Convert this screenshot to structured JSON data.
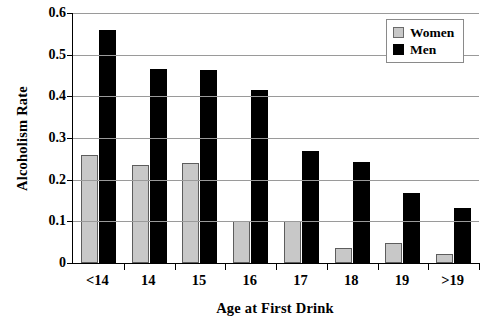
{
  "chart_data": {
    "type": "bar",
    "title": "",
    "xlabel": "Age at First Drink",
    "ylabel": "Alcoholism Rate",
    "categories": [
      "<14",
      "14",
      "15",
      "16",
      "17",
      "18",
      "19",
      ">19"
    ],
    "series": [
      {
        "name": "Women",
        "color": "#c8c8c8",
        "values": [
          0.26,
          0.236,
          0.239,
          0.102,
          0.102,
          0.035,
          0.047,
          0.021
        ]
      },
      {
        "name": "Men",
        "color": "#000000",
        "values": [
          0.56,
          0.465,
          0.464,
          0.415,
          0.27,
          0.242,
          0.167,
          0.131
        ]
      }
    ],
    "ylim": [
      0,
      0.6
    ],
    "ytick_values": [
      0,
      0.1,
      0.2,
      0.3,
      0.4,
      0.5,
      0.6
    ],
    "ytick_labels": [
      "0",
      "0.1",
      "0.2",
      "0.3",
      "0.4",
      "0.5",
      "0.6"
    ],
    "grid": true,
    "grid_axis": "y",
    "legend_position": "top-right",
    "legend_entries": [
      "Women",
      "Men"
    ]
  }
}
